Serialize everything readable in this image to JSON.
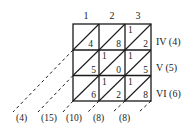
{
  "column_headers": [
    "1",
    "2",
    "3"
  ],
  "row_labels": [
    "IV (4)",
    "V (5)",
    "VI (6)"
  ],
  "cells": [
    [
      {
        "tens": "",
        "units": "4"
      },
      {
        "tens": "",
        "units": "8"
      },
      {
        "tens": "1",
        "units": "2"
      }
    ],
    [
      {
        "tens": "",
        "units": "5"
      },
      {
        "tens": "1",
        "units": "0"
      },
      {
        "tens": "1",
        "units": "5"
      }
    ],
    [
      {
        "tens": "",
        "units": "6"
      },
      {
        "tens": "1",
        "units": "2"
      },
      {
        "tens": "1",
        "units": "8"
      }
    ]
  ],
  "diagonal_sums": [
    "(4)",
    "(15)",
    "(10)",
    "(8)",
    "(8)"
  ],
  "colors": {
    "ink": "#1a1a1a",
    "background": "#ffffff"
  }
}
